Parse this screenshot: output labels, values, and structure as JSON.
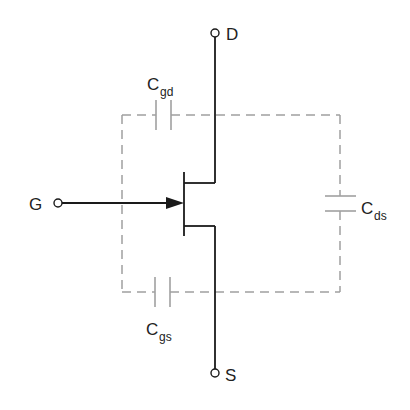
{
  "diagram": {
    "terminals": {
      "drain": "D",
      "gate": "G",
      "source": "S"
    },
    "capacitors": {
      "gate_drain": {
        "main": "C",
        "sub": "gd"
      },
      "gate_source": {
        "main": "C",
        "sub": "gs"
      },
      "drain_source": {
        "main": "C",
        "sub": "ds"
      }
    },
    "colors": {
      "circuit": "#1a1a1a",
      "dashed": "#a0a0a0",
      "text": "#222222"
    }
  }
}
